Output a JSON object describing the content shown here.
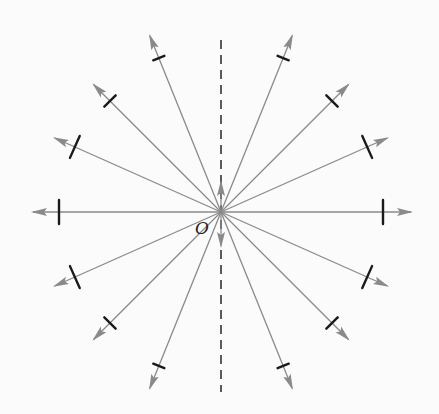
{
  "diagram": {
    "type": "radial field lines from point charge",
    "origin_label": "O",
    "center": {
      "x": 221,
      "y": 212
    },
    "colors": {
      "arrow": "#8a8a8a",
      "tick": "#1a1a1a",
      "dashed_axis": "#333333",
      "background": "#fbfbfb"
    },
    "dashed_axis": {
      "x": 221,
      "y_top": 40,
      "y_bottom": 392
    },
    "inner_arrows": [
      {
        "direction": "up",
        "tip_y": 182
      },
      {
        "direction": "down",
        "tip_y": 246
      }
    ],
    "rays": [
      {
        "angle_deg": 0,
        "length": 190,
        "tick_at": 162,
        "tick_len": 24
      },
      {
        "angle_deg": 24,
        "length": 182,
        "tick_at": 160,
        "tick_len": 24
      },
      {
        "angle_deg": 45,
        "length": 180,
        "tick_at": 157,
        "tick_len": 16
      },
      {
        "angle_deg": 68,
        "length": 190,
        "tick_at": 166,
        "tick_len": 12
      },
      {
        "angle_deg": 112,
        "length": 190,
        "tick_at": 166,
        "tick_len": 12
      },
      {
        "angle_deg": 135,
        "length": 180,
        "tick_at": 157,
        "tick_len": 16
      },
      {
        "angle_deg": 156,
        "length": 182,
        "tick_at": 160,
        "tick_len": 24
      },
      {
        "angle_deg": 180,
        "length": 188,
        "tick_at": 162,
        "tick_len": 24
      },
      {
        "angle_deg": 204,
        "length": 182,
        "tick_at": 160,
        "tick_len": 24
      },
      {
        "angle_deg": 225,
        "length": 180,
        "tick_at": 157,
        "tick_len": 16
      },
      {
        "angle_deg": 248,
        "length": 190,
        "tick_at": 166,
        "tick_len": 12
      },
      {
        "angle_deg": 292,
        "length": 190,
        "tick_at": 166,
        "tick_len": 12
      },
      {
        "angle_deg": 315,
        "length": 180,
        "tick_at": 157,
        "tick_len": 16
      },
      {
        "angle_deg": 336,
        "length": 182,
        "tick_at": 160,
        "tick_len": 24
      }
    ]
  }
}
